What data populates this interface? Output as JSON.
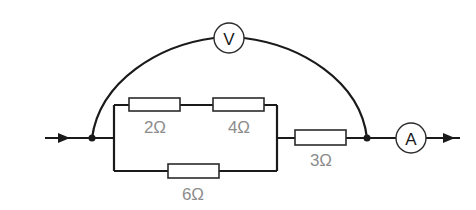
{
  "diagram": {
    "type": "electric-circuit",
    "voltmeter": {
      "label": "V"
    },
    "ammeter": {
      "label": "A"
    },
    "resistors": [
      {
        "id": "r1",
        "label": "2Ω",
        "branch": "parallel-top"
      },
      {
        "id": "r2",
        "label": "4Ω",
        "branch": "parallel-top"
      },
      {
        "id": "r3",
        "label": "6Ω",
        "branch": "parallel-bottom"
      },
      {
        "id": "r4",
        "label": "3Ω",
        "branch": "series"
      }
    ],
    "current_direction": "left-to-right"
  }
}
